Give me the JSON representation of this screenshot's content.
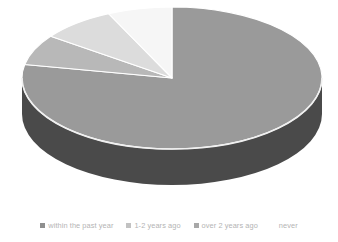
{
  "chart_data": {
    "type": "pie",
    "title": "",
    "subtitle": "",
    "xlabel": "",
    "ylabel": "",
    "three_d": true,
    "grid": false,
    "legend_position": "bottom",
    "start_angle_deg": 0,
    "direction": "clockwise",
    "categories": [
      "within the past year",
      "1-2 years ago",
      "over 2 years ago",
      "never"
    ],
    "values": [
      78,
      7,
      8,
      7
    ],
    "units": "percent",
    "slices": [
      {
        "label": "within the past year",
        "value": 78,
        "color": "#9a9a9a",
        "side_color": "#4a4a4a",
        "start_angle_deg": 0,
        "end_angle_deg": 281
      },
      {
        "label": "1-2 years ago",
        "value": 7,
        "color": "#b8b8b8",
        "side_color": "#6e6e6e",
        "start_angle_deg": 281,
        "end_angle_deg": 306
      },
      {
        "label": "over 2 years ago",
        "value": 8,
        "color": "#dcdcdc",
        "side_color": "#8c8c8c",
        "start_angle_deg": 306,
        "end_angle_deg": 335
      },
      {
        "label": "never",
        "value": 7,
        "color": "#f6f6f6",
        "side_color": "#a8a8a8",
        "start_angle_deg": 335,
        "end_angle_deg": 360
      }
    ]
  },
  "legend": {
    "items": [
      {
        "label": "within the past year",
        "color": "#8f8f8f"
      },
      {
        "label": "1-2 years ago",
        "color": "#c2c2c2"
      },
      {
        "label": "over 2 years ago",
        "color": "#a8a8a8"
      },
      {
        "label": "never",
        "color": "#ffffff"
      }
    ]
  },
  "style": {
    "background": "#ffffff",
    "legend_text_color": "#b4b4b4",
    "rim_highlight": "#f0f0f0"
  }
}
